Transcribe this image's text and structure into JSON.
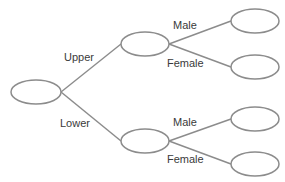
{
  "diagram": {
    "type": "tree-diagram",
    "colors": {
      "line": "#8c8c8c",
      "node_stroke": "#8c8c8c",
      "node_fill": "#ffffff",
      "text": "#3a3a3a"
    },
    "root": {
      "id": "root",
      "cx": 36,
      "cy": 92,
      "rx": 25,
      "ry": 12,
      "label": ""
    },
    "level1": [
      {
        "id": "upper",
        "branch_label": "Upper",
        "cx": 145,
        "cy": 44,
        "rx": 24,
        "ry": 12,
        "label_x": 64,
        "label_y": 51
      },
      {
        "id": "lower",
        "branch_label": "Lower",
        "cx": 145,
        "cy": 141,
        "rx": 24,
        "ry": 12,
        "label_x": 60,
        "label_y": 117
      }
    ],
    "level2": [
      {
        "parent": "upper",
        "branch_label": "Male",
        "cx": 255,
        "cy": 21,
        "rx": 24,
        "ry": 12,
        "label_x": 173,
        "label_y": 19
      },
      {
        "parent": "upper",
        "branch_label": "Female",
        "cx": 255,
        "cy": 67,
        "rx": 24,
        "ry": 12,
        "label_x": 167,
        "label_y": 57
      },
      {
        "parent": "lower",
        "branch_label": "Male",
        "cx": 255,
        "cy": 119,
        "rx": 24,
        "ry": 12,
        "label_x": 173,
        "label_y": 116
      },
      {
        "parent": "lower",
        "branch_label": "Female",
        "cx": 255,
        "cy": 164,
        "rx": 24,
        "ry": 12,
        "label_x": 167,
        "label_y": 153
      }
    ]
  }
}
